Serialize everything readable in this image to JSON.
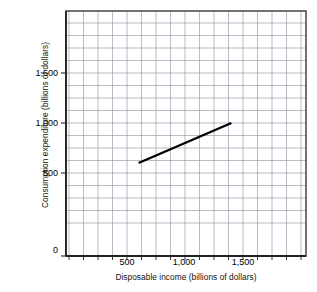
{
  "chart_data": {
    "type": "line",
    "title": "",
    "xlabel": "Disposable income (billions of dollars)",
    "ylabel": "Consumption expenditure (billions of dollars)",
    "xlim": [
      0,
      2100
    ],
    "ylim": [
      0,
      2200
    ],
    "xticks": [
      500,
      1000,
      1500
    ],
    "xtick_labels": [
      "500",
      "1,000",
      "1,500"
    ],
    "yticks": [
      0,
      500,
      1000,
      1500
    ],
    "ytick_labels": [
      "0",
      "500",
      "1,000",
      "1,500"
    ],
    "grid": true,
    "grid_color": "#8b8fa3",
    "minor_grid_step_x": 125,
    "minor_grid_step_y": 125,
    "legend": null,
    "series": [
      {
        "name": "Consumption function",
        "color": "#000000",
        "x": [
          600,
          1400
        ],
        "y": [
          600,
          1000
        ],
        "slope": 0.5,
        "intercept": 300
      }
    ]
  },
  "axis": {
    "x_title": "Disposable income (billions of dollars)",
    "y_title": "Consumption expenditure (billions of dollars)",
    "x_tick_labels": [
      "500",
      "1,000",
      "1,500"
    ],
    "y_tick_labels": [
      "1,500",
      "1,000",
      "500",
      "0"
    ]
  }
}
